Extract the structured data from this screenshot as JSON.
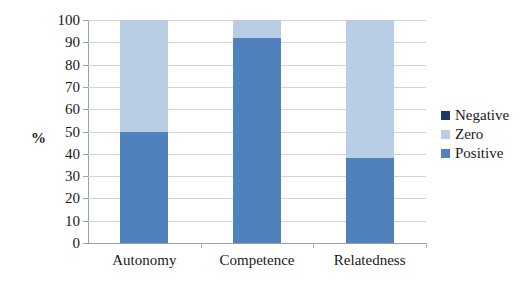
{
  "chart_data": {
    "type": "bar",
    "subtype": "stacked-bar-100",
    "title": "",
    "xlabel": "",
    "ylabel": "%",
    "ylim": [
      0,
      100
    ],
    "ytick_step": 10,
    "yticks": [
      100,
      90,
      80,
      70,
      60,
      50,
      40,
      30,
      20,
      10,
      0
    ],
    "categories": [
      "Autonomy",
      "Competence",
      "Relatedness"
    ],
    "grid": true,
    "legend_position": "right",
    "series": [
      {
        "name": "Negative",
        "color": "#1f3864",
        "values": [
          0,
          0,
          0
        ]
      },
      {
        "name": "Zero",
        "color": "#b9cde5",
        "values": [
          50,
          8,
          62
        ]
      },
      {
        "name": "Positive",
        "color": "#4f81bd",
        "values": [
          50,
          92,
          38
        ]
      }
    ]
  },
  "legend": {
    "items": [
      {
        "label": "Negative",
        "color": "#1f3864"
      },
      {
        "label": "Zero",
        "color": "#b9cde5"
      },
      {
        "label": "Positive",
        "color": "#4f81bd"
      }
    ]
  },
  "colors": {
    "negative": "#1f3864",
    "zero": "#b9cde5",
    "positive": "#4f81bd",
    "gridline": "#d4d4d4",
    "axis": "#9aa0a6",
    "text": "#1a1a1a",
    "background": "#ffffff"
  }
}
